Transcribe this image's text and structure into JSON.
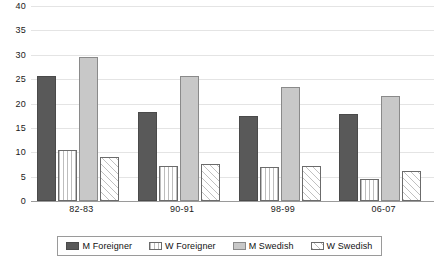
{
  "chart_data": {
    "type": "bar",
    "title": "",
    "subtitle": "",
    "xlabel": "",
    "ylabel": "",
    "categories": [
      "82-83",
      "90-91",
      "98-99",
      "06-07"
    ],
    "series": [
      {
        "name": "M Foreigner",
        "color": "#595959",
        "pattern": "solid-dark",
        "values": [
          25.6,
          18.2,
          17.4,
          17.9
        ]
      },
      {
        "name": "W Foreigner",
        "color": "#ffffff",
        "pattern": "vertical-lines",
        "values": [
          10.4,
          7.1,
          6.9,
          4.5
        ]
      },
      {
        "name": "M Swedish",
        "color": "#c8c8c8",
        "pattern": "solid-light",
        "values": [
          29.6,
          25.7,
          23.3,
          21.5
        ]
      },
      {
        "name": "W Swedish",
        "color": "#ffffff",
        "pattern": "diagonal-hatch",
        "values": [
          9.1,
          7.5,
          7.2,
          6.1
        ]
      }
    ],
    "ylim": [
      0,
      40
    ],
    "ytick_step": 5,
    "yticks": [
      0,
      5,
      10,
      15,
      20,
      25,
      30,
      35,
      40
    ],
    "ytick_labels": [
      "0",
      "5",
      "10",
      "15",
      "20",
      "25",
      "30",
      "35",
      "40"
    ],
    "grid": true,
    "grid_axis": "y",
    "legend_position": "bottom",
    "legend_entries": [
      "M Foreigner",
      "W Foreigner",
      "M Swedish",
      "W Swedish"
    ]
  }
}
